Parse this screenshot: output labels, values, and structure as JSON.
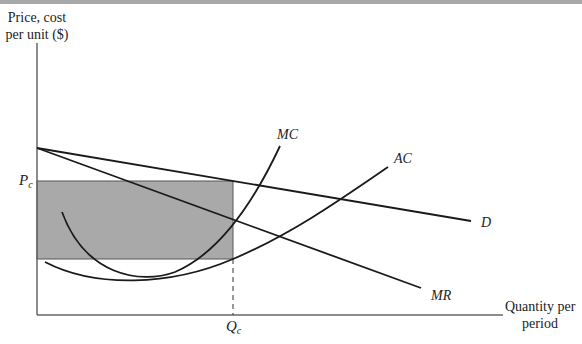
{
  "figure": {
    "y_axis_label_line1": "Price, cost",
    "y_axis_label_line2": "per unit ($)",
    "x_axis_label_line1": "Quantity per",
    "x_axis_label_line2": "period",
    "price_label": {
      "main": "P",
      "sub": "c"
    },
    "quantity_label": {
      "main": "Q",
      "sub": "c"
    },
    "curves": {
      "mc": "MC",
      "ac": "AC",
      "d": "D",
      "mr": "MR"
    },
    "colors": {
      "line": "#1a1a1a",
      "axis": "#555555",
      "shaded_area": "#a9a9a9",
      "top_bar": "#a8a8a8"
    }
  }
}
